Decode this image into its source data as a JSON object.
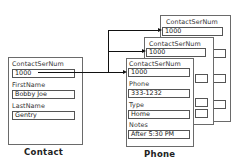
{
  "contact": {
    "caption": "Contact",
    "fields": [
      {
        "label": "ContactSerNum",
        "value": "1000"
      },
      {
        "label": "FirstName",
        "value": "Bobby Joe"
      },
      {
        "label": "LastName",
        "value": "Gentry"
      }
    ]
  },
  "phone": {
    "caption": "Phone",
    "back_records": [
      {
        "label": "ContactSerNum",
        "value": "1000"
      },
      {
        "label": "ContactSerNum",
        "value": "1000"
      }
    ],
    "front_record": [
      {
        "label": "ContactSerNum",
        "value": "1000"
      },
      {
        "label": "Phone",
        "value": "333-1232"
      },
      {
        "label": "Type",
        "value": "Home"
      },
      {
        "label": "Notes",
        "value": "After 5:30 PM"
      }
    ]
  }
}
